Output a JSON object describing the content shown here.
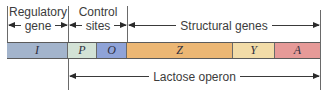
{
  "diagram": {
    "watermark": "",
    "regions": {
      "regulatory": {
        "line1": "Regulatory",
        "line2": "gene"
      },
      "control": {
        "line1": "Control",
        "line2": "sites"
      },
      "structural": {
        "label": "Structural genes"
      },
      "operon": {
        "label": "Lactose operon"
      }
    },
    "segments": [
      {
        "symbol": "I",
        "name": "regulatory-gene-i",
        "x_start": 7,
        "x_end": 68,
        "color": "#a3b4cc"
      },
      {
        "symbol": "P",
        "name": "promoter-p",
        "x_start": 68,
        "x_end": 97,
        "color": "#d3e2d6"
      },
      {
        "symbol": "O",
        "name": "operator-o",
        "x_start": 97,
        "x_end": 127,
        "color": "#8fa3d8"
      },
      {
        "symbol": "Z",
        "name": "structural-gene-z",
        "x_start": 127,
        "x_end": 233,
        "color": "#ecb774"
      },
      {
        "symbol": "Y",
        "name": "structural-gene-y",
        "x_start": 233,
        "x_end": 275,
        "color": "#f2dca8"
      },
      {
        "symbol": "A",
        "name": "structural-gene-a",
        "x_start": 275,
        "x_end": 320,
        "color": "#e69a98"
      }
    ],
    "colors": {
      "line": "#6a6a6a",
      "text": "#3c3c3c"
    }
  }
}
